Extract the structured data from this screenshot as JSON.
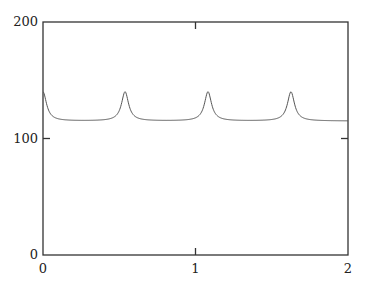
{
  "chart_data": {
    "type": "line",
    "title": "",
    "xlabel": "",
    "ylabel": "",
    "xlim": [
      0,
      2
    ],
    "ylim": [
      0,
      200
    ],
    "grid": false,
    "legend": null,
    "x_ticks": [
      0,
      1,
      2
    ],
    "x_tick_labels": [
      "0",
      "1",
      "2"
    ],
    "y_ticks": [
      0,
      100,
      200
    ],
    "y_tick_labels": [
      "0",
      "100",
      "200"
    ],
    "series": [
      {
        "name": "signal",
        "color": "#555555",
        "description": "Periodic sharp peaks on a flat baseline",
        "baseline": 115,
        "peak_value": 140,
        "peak_x": [
          0.0,
          0.538,
          1.082,
          1.626
        ],
        "period": 0.544,
        "x": [
          0.0,
          0.05,
          0.1,
          0.2,
          0.3,
          0.4,
          0.48,
          0.52,
          0.538,
          0.56,
          0.6,
          0.7,
          0.8,
          0.9,
          1.0,
          1.04,
          1.07,
          1.082,
          1.1,
          1.14,
          1.3,
          1.5,
          1.58,
          1.61,
          1.626,
          1.645,
          1.68,
          1.8,
          1.9,
          2.0
        ],
        "values": [
          139,
          122,
          117,
          115,
          115,
          115,
          118,
          128,
          140,
          128,
          118,
          115,
          115,
          115,
          116,
          121,
          133,
          140,
          131,
          119,
          115,
          116,
          121,
          133,
          140,
          130,
          119,
          115,
          115,
          115
        ]
      }
    ]
  }
}
